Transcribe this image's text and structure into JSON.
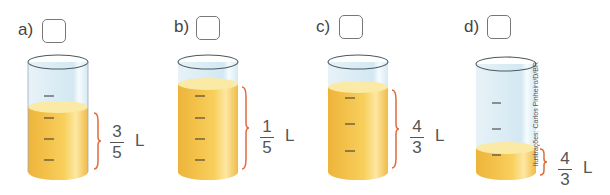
{
  "colors": {
    "liquid": "#f5c64a",
    "liquid_light": "#fbe9a6",
    "glass": "#dcedf5",
    "brace": "#e06a3c",
    "outline": "#5a6a72"
  },
  "items": [
    {
      "label": "a)",
      "numerator": "3",
      "denominator": "5",
      "unit": "L",
      "fill_level": 0.62
    },
    {
      "label": "b)",
      "numerator": "1",
      "denominator": "5",
      "unit": "L",
      "fill_level": 0.83
    },
    {
      "label": "c)",
      "numerator": "4",
      "denominator": "3",
      "unit": "L",
      "fill_level": 0.8
    },
    {
      "label": "d)",
      "numerator": "4",
      "denominator": "3",
      "unit": "L",
      "fill_level": 0.23
    }
  ],
  "credit": "Ilustrações: Carlos Pinheiro/D/BR"
}
